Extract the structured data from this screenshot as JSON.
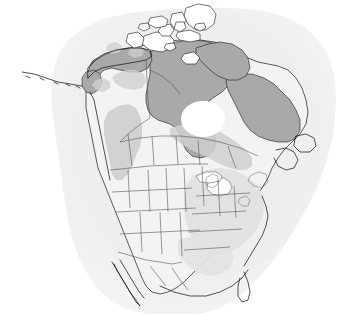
{
  "figure": {
    "kind": "range-map",
    "region": "North America",
    "title": "",
    "caption": "",
    "width": 342,
    "height": 316,
    "background_color": "#ffffff"
  },
  "legend": {
    "visible": false,
    "entries": [
      {
        "label": "Core range",
        "color": "#a9a9a9"
      },
      {
        "label": "Intermediate range",
        "color": "#cfcfcf"
      },
      {
        "label": "Marginal / absent",
        "color": "#f3f3f3"
      },
      {
        "label": "Ocean halo",
        "color": "#ededed"
      }
    ]
  },
  "colors": {
    "ocean_halo": "#ededed",
    "ocean_halo_outer": "#f4f4f4",
    "land_base": "#f3f3f3",
    "shade_light": "#e2e2e2",
    "shade_medium": "#cfcfcf",
    "shade_dark": "#a9a9a9",
    "water_white": "#ffffff",
    "coast_line": "#1a1a1a",
    "internal_border": "#4a4a4a",
    "page_background": "#ffffff"
  },
  "layers": [
    {
      "name": "ocean-halo",
      "label": "Ocean halo backdrop",
      "color": "#ededed"
    },
    {
      "name": "landmass",
      "label": "North American landmass",
      "color": "#f3f3f3"
    },
    {
      "name": "range-dark",
      "label": "Canadian Arctic and Alaska core range",
      "color": "#a9a9a9"
    },
    {
      "name": "range-medium",
      "label": "Western cordillera and boreal band",
      "color": "#cfcfcf"
    },
    {
      "name": "range-light",
      "label": "Eastern United States light shading",
      "color": "#e2e2e2"
    },
    {
      "name": "hudson-bay",
      "label": "Hudson Bay open water",
      "color": "#ffffff"
    },
    {
      "name": "great-lakes",
      "label": "Great Lakes",
      "color": "#ffffff"
    },
    {
      "name": "political-borders",
      "label": "State and province boundaries",
      "color": "#4a4a4a"
    },
    {
      "name": "coastlines",
      "label": "Coastlines",
      "color": "#1a1a1a"
    }
  ],
  "features": {
    "alaska": "Alaska",
    "yukon": "Yukon",
    "northwest_territories": "Northwest Territories",
    "nunavut": "Nunavut",
    "arctic_archipelago": "Canadian Arctic Archipelago",
    "british_columbia": "British Columbia",
    "alberta": "Alberta",
    "saskatchewan": "Saskatchewan",
    "manitoba": "Manitoba",
    "ontario": "Ontario",
    "quebec": "Quebec",
    "labrador": "Labrador",
    "newfoundland": "Newfoundland",
    "hudson_bay": "Hudson Bay",
    "great_lakes": "Great Lakes",
    "united_states": "United States",
    "baja_california": "Baja California",
    "florida": "Florida",
    "aleutian_islands": "Aleutian Islands"
  }
}
